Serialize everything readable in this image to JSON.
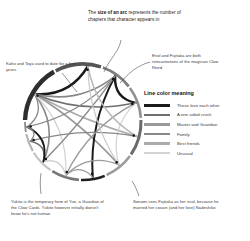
{
  "figure": {
    "type": "chord-diagram"
  },
  "annotations": {
    "arc_size": {
      "lead": "The ",
      "bold": "size of an arc",
      "rest": " represents the number of chapters that character appears in"
    },
    "eriol": "Eriol and Fujitaka are both reincarnations of the magician Clow Reed",
    "kaho": "Kaho and Toya used to date for a few years",
    "yukito": "Yukito is the temporary form of Yue, a Guardian of the Clow Cards. Yukito however initially doesn't know he's not human",
    "sonomi": "Sonomi sees Fujitaka as her rival, because he married her cousin (and her love) Nadeshiko"
  },
  "legend": {
    "title": "Line color meaning",
    "items": [
      {
        "label": "These love each other",
        "color": "#1a1a1a"
      },
      {
        "label": "A one-sided crush",
        "color": "#6e6e6e"
      },
      {
        "label": "Master and Guardian",
        "color": "#9a9a9a"
      },
      {
        "label": "Family",
        "color": "#888888"
      },
      {
        "label": "Best friends",
        "color": "#ababab"
      },
      {
        "label": "Unusual",
        "color": "#d2d2d2"
      }
    ]
  },
  "chart_data": {
    "type": "chord",
    "center": {
      "x": 83,
      "y": 122
    },
    "radius": 58,
    "arc_thickness_meaning": "number of chapters the character appears in",
    "arcs": [
      {
        "name": "Sakura",
        "start_deg": 272,
        "end_deg": 330,
        "width": 4.4,
        "color": "#2e2e2e"
      },
      {
        "name": "Syaoran",
        "start_deg": 332,
        "end_deg": 18,
        "width": 3.6,
        "color": "#555555"
      },
      {
        "name": "Toya",
        "start_deg": 20,
        "end_deg": 52,
        "width": 2.8,
        "color": "#7d7d7d"
      },
      {
        "name": "Yukito",
        "start_deg": 54,
        "end_deg": 86,
        "width": 2.6,
        "color": "#909090"
      },
      {
        "name": "Tomoyo",
        "start_deg": 88,
        "end_deg": 124,
        "width": 3.0,
        "color": "#6a6a6a"
      },
      {
        "name": "Kero",
        "start_deg": 126,
        "end_deg": 156,
        "width": 2.6,
        "color": "#9d9d9d"
      },
      {
        "name": "Kaho",
        "start_deg": 158,
        "end_deg": 182,
        "width": 2.4,
        "color": "#1f1f1f"
      },
      {
        "name": "Eriol",
        "start_deg": 184,
        "end_deg": 212,
        "width": 2.6,
        "color": "#787878"
      },
      {
        "name": "Fujitaka",
        "start_deg": 214,
        "end_deg": 238,
        "width": 2.3,
        "color": "#c4c4c4"
      },
      {
        "name": "Sonomi",
        "start_deg": 240,
        "end_deg": 258,
        "width": 2.1,
        "color": "#b3b3b3"
      },
      {
        "name": "Nadeshiko",
        "start_deg": 260,
        "end_deg": 270,
        "width": 1.8,
        "color": "#8c8c8c"
      }
    ],
    "chords": [
      {
        "from_deg": 300,
        "to_deg": 5,
        "color": "#1a1a1a",
        "width": 2.6,
        "relation": "These love each other"
      },
      {
        "from_deg": 300,
        "to_deg": 105,
        "color": "#ababab",
        "width": 1.5,
        "relation": "Best friends"
      },
      {
        "from_deg": 300,
        "to_deg": 140,
        "color": "#9a9a9a",
        "width": 1.7,
        "relation": "Master and Guardian"
      },
      {
        "from_deg": 300,
        "to_deg": 35,
        "color": "#888888",
        "width": 1.6,
        "relation": "Family"
      },
      {
        "from_deg": 300,
        "to_deg": 225,
        "color": "#888888",
        "width": 1.6,
        "relation": "Family"
      },
      {
        "from_deg": 300,
        "to_deg": 265,
        "color": "#888888",
        "width": 1.3,
        "relation": "Family"
      },
      {
        "from_deg": 300,
        "to_deg": 70,
        "color": "#6e6e6e",
        "width": 1.5,
        "relation": "A one-sided crush"
      },
      {
        "from_deg": 300,
        "to_deg": 198,
        "color": "#d2d2d2",
        "width": 1.2,
        "relation": "Unusual"
      },
      {
        "from_deg": 35,
        "to_deg": 70,
        "color": "#1a1a1a",
        "width": 2.4,
        "relation": "These love each other"
      },
      {
        "from_deg": 35,
        "to_deg": 170,
        "color": "#1a1a1a",
        "width": 2.0,
        "relation": "These love each other"
      },
      {
        "from_deg": 35,
        "to_deg": 225,
        "color": "#888888",
        "width": 1.4,
        "relation": "Family"
      },
      {
        "from_deg": 35,
        "to_deg": 265,
        "color": "#888888",
        "width": 1.2,
        "relation": "Family"
      },
      {
        "from_deg": 70,
        "to_deg": 140,
        "color": "#d2d2d2",
        "width": 1.2,
        "relation": "Unusual"
      },
      {
        "from_deg": 70,
        "to_deg": 198,
        "color": "#9a9a9a",
        "width": 1.4,
        "relation": "Master and Guardian"
      },
      {
        "from_deg": 105,
        "to_deg": 250,
        "color": "#888888",
        "width": 1.3,
        "relation": "Family"
      },
      {
        "from_deg": 105,
        "to_deg": 5,
        "color": "#ababab",
        "width": 1.2,
        "relation": "Best friends"
      },
      {
        "from_deg": 140,
        "to_deg": 198,
        "color": "#9a9a9a",
        "width": 1.4,
        "relation": "Master and Guardian"
      },
      {
        "from_deg": 170,
        "to_deg": 198,
        "color": "#9a9a9a",
        "width": 1.3,
        "relation": "Master and Guardian"
      },
      {
        "from_deg": 198,
        "to_deg": 225,
        "color": "#d2d2d2",
        "width": 1.4,
        "relation": "Unusual"
      },
      {
        "from_deg": 225,
        "to_deg": 250,
        "color": "#6e6e6e",
        "width": 1.5,
        "relation": "A one-sided crush"
      },
      {
        "from_deg": 225,
        "to_deg": 265,
        "color": "#1a1a1a",
        "width": 1.8,
        "relation": "These love each other"
      },
      {
        "from_deg": 250,
        "to_deg": 265,
        "color": "#888888",
        "width": 1.3,
        "relation": "Family"
      },
      {
        "from_deg": 5,
        "to_deg": 140,
        "color": "#c9c9c9",
        "width": 1.2,
        "relation": "Unusual"
      },
      {
        "from_deg": 5,
        "to_deg": 105,
        "color": "#bdbdbd",
        "width": 1.2,
        "relation": "Best friends"
      }
    ]
  }
}
